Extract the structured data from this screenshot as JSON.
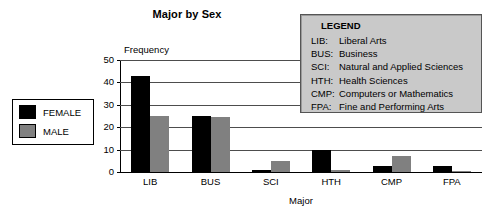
{
  "chart_data": {
    "type": "bar",
    "title": "Major by Sex",
    "xlabel": "Major",
    "ylabel": "Frequency",
    "categories": [
      "LIB",
      "BUS",
      "SCI",
      "HTH",
      "CMP",
      "FPA"
    ],
    "series": [
      {
        "name": "FEMALE",
        "color": "#000000",
        "values": [
          43,
          25,
          1,
          10,
          2.5,
          2.5
        ]
      },
      {
        "name": "MALE",
        "color": "#808080",
        "values": [
          25,
          24.5,
          5,
          1,
          7,
          0.5
        ]
      }
    ],
    "ylim": [
      0,
      50
    ],
    "yticks": [
      0,
      10,
      20,
      30,
      40,
      50
    ],
    "ytick_labels": [
      "0",
      "10",
      "20",
      "30",
      "40",
      "50"
    ],
    "grid": "horizontal",
    "legend_position": "left-outside"
  },
  "series_key": {
    "items": [
      {
        "label": "FEMALE",
        "color": "#000000"
      },
      {
        "label": "MALE",
        "color": "#808080"
      }
    ]
  },
  "legend_panel": {
    "title": "LEGEND",
    "entries": [
      {
        "code": "LIB:",
        "description": "Liberal Arts"
      },
      {
        "code": "BUS:",
        "description": "Business"
      },
      {
        "code": "SCI:",
        "description": "Natural and Applied Sciences"
      },
      {
        "code": "HTH:",
        "description": "Health Sciences"
      },
      {
        "code": "CMP:",
        "description": "Computers or Mathematics"
      },
      {
        "code": "FPA:",
        "description": "Fine and Performing Arts"
      }
    ]
  },
  "colors": {
    "female_bar": "#000000",
    "male_bar": "#808080",
    "legend_background": "#c9c9c9",
    "legend_border": "#555555",
    "axis": "#000000",
    "gridline": "#4d4d4d"
  }
}
